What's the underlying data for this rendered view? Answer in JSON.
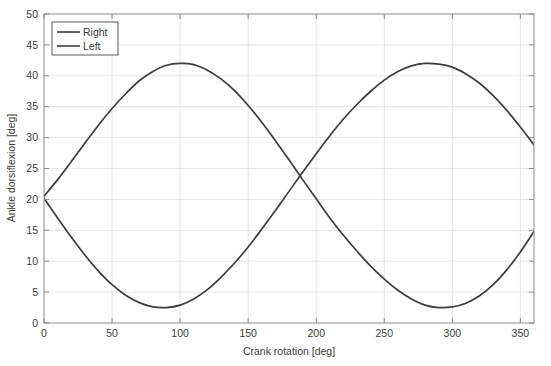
{
  "chart_data": {
    "type": "line",
    "title": "",
    "subtitle": "",
    "xlabel": "Crank rotation [deg]",
    "ylabel": "Ankle dorsiflexion [deg]",
    "xlim": [
      0,
      360
    ],
    "ylim": [
      0,
      50
    ],
    "xticks": [
      0,
      50,
      100,
      150,
      200,
      250,
      300,
      350
    ],
    "yticks": [
      0,
      5,
      10,
      15,
      20,
      25,
      30,
      35,
      40,
      45,
      50
    ],
    "xtick_labels": [
      "0",
      "50",
      "100",
      "150",
      "200",
      "250",
      "300",
      "350"
    ],
    "ytick_labels": [
      "0",
      "5",
      "10",
      "15",
      "20",
      "25",
      "30",
      "35",
      "40",
      "45",
      "50"
    ],
    "grid": true,
    "legend_position": "upper left",
    "line_color": "#3d3d3d",
    "grid_color": "#e6e6e6",
    "axes_color": "#8c8c8c",
    "background_color": "#ffffff",
    "series": [
      {
        "name": "Right",
        "color": "#3d3d3d",
        "x": [
          0,
          10,
          20,
          30,
          40,
          50,
          60,
          70,
          80,
          90,
          100,
          110,
          120,
          130,
          140,
          150,
          160,
          170,
          180,
          190,
          200,
          210,
          220,
          230,
          240,
          250,
          260,
          270,
          280,
          290,
          300,
          310,
          320,
          330,
          340,
          350,
          360
        ],
        "values": [
          20.5,
          23.2,
          26.1,
          29.1,
          32.0,
          34.7,
          37.1,
          39.2,
          40.7,
          41.7,
          42.0,
          41.8,
          40.9,
          39.5,
          37.6,
          35.2,
          32.5,
          29.5,
          26.4,
          23.2,
          20.1,
          17.0,
          14.2,
          11.6,
          9.2,
          7.1,
          5.3,
          3.9,
          2.9,
          2.5,
          2.6,
          3.2,
          4.4,
          6.2,
          8.6,
          11.5,
          14.8
        ]
      },
      {
        "name": "Left",
        "color": "#3d3d3d",
        "x": [
          0,
          10,
          20,
          30,
          40,
          50,
          60,
          70,
          80,
          90,
          100,
          110,
          120,
          130,
          140,
          150,
          160,
          170,
          180,
          190,
          200,
          210,
          220,
          230,
          240,
          250,
          260,
          270,
          280,
          290,
          300,
          310,
          320,
          330,
          340,
          350,
          360
        ],
        "values": [
          20.2,
          17.0,
          13.9,
          11.0,
          8.4,
          6.2,
          4.5,
          3.3,
          2.6,
          2.5,
          2.9,
          3.9,
          5.4,
          7.4,
          9.7,
          12.3,
          15.2,
          18.2,
          21.3,
          24.4,
          27.4,
          30.3,
          33.0,
          35.4,
          37.5,
          39.3,
          40.7,
          41.6,
          42.0,
          41.9,
          41.4,
          40.3,
          38.8,
          36.8,
          34.4,
          31.7,
          28.8
        ]
      }
    ],
    "annotations": {
      "right_peak": {
        "x": 103,
        "y": 42
      },
      "right_trough": {
        "x": 288,
        "y": 2.5
      },
      "left_trough": {
        "x": 81,
        "y": 2.5
      },
      "left_peak": {
        "x": 283,
        "y": 42
      },
      "crossing_left": {
        "x": 2,
        "y": 20.3
      },
      "crossing_mid": {
        "x": 183,
        "y": 22.2
      }
    }
  },
  "legend": {
    "items": [
      {
        "label": "Right"
      },
      {
        "label": "Left"
      }
    ]
  },
  "axes": {
    "x_title": "Crank rotation [deg]",
    "y_title": "Ankle dorsiflexion [deg]"
  }
}
